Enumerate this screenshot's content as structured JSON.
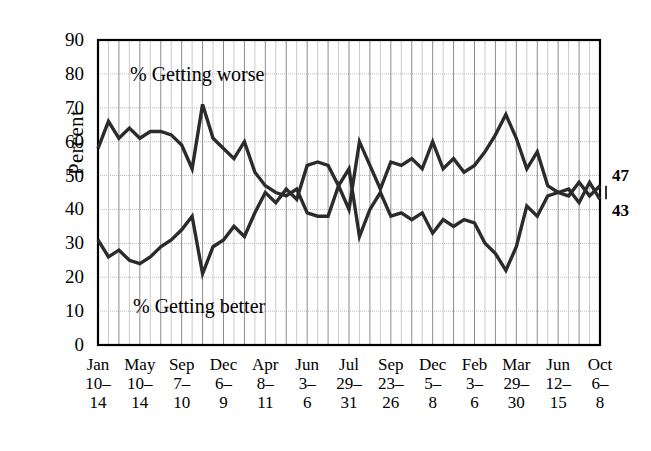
{
  "chart_data": {
    "type": "line",
    "title": "",
    "xlabel": "",
    "ylabel": "Percent",
    "ylim": [
      0,
      90
    ],
    "ytick_step": 10,
    "yticks": [
      "0",
      "10",
      "20",
      "30",
      "40",
      "50",
      "60",
      "70",
      "80",
      "90"
    ],
    "grid": true,
    "grid_vertical": true,
    "legend_position": "inline-annotation",
    "annotations": [
      {
        "text": "% Getting worse",
        "series": "% Getting worse"
      },
      {
        "text": "% Getting better",
        "series": "% Getting better"
      }
    ],
    "end_labels": [
      {
        "text": "47",
        "series": "% Getting worse",
        "value": 47
      },
      {
        "text": "43",
        "series": "% Getting better",
        "value": 43
      }
    ],
    "xtick_labels": [
      {
        "line1": "Jan",
        "line2": "10–",
        "line3": "14",
        "index": 0
      },
      {
        "line1": "May",
        "line2": "10–",
        "line3": "14",
        "index": 4
      },
      {
        "line1": "Sep",
        "line2": "7–",
        "line3": "10",
        "index": 8
      },
      {
        "line1": "Dec",
        "line2": "6–",
        "line3": "9",
        "index": 12
      },
      {
        "line1": "Apr",
        "line2": "8–",
        "line3": "11",
        "index": 16
      },
      {
        "line1": "Jun",
        "line2": "3–",
        "line3": "6",
        "index": 20
      },
      {
        "line1": "Jul",
        "line2": "29–",
        "line3": "31",
        "index": 24
      },
      {
        "line1": "Sep",
        "line2": "23–",
        "line3": "26",
        "index": 28
      },
      {
        "line1": "Dec",
        "line2": "5–",
        "line3": "8",
        "index": 32
      },
      {
        "line1": "Feb",
        "line2": "3–",
        "line3": "6",
        "index": 36
      },
      {
        "line1": "Mar",
        "line2": "29–",
        "line3": "30",
        "index": 40
      },
      {
        "line1": "Jun",
        "line2": "12–",
        "line3": "15",
        "index": 44
      },
      {
        "line1": "Oct",
        "line2": "6–",
        "line3": "8",
        "index": 48
      }
    ],
    "series": [
      {
        "name": "% Getting worse",
        "color": "#2b2b2b",
        "values": [
          58,
          66,
          61,
          64,
          61,
          63,
          63,
          62,
          59,
          52,
          71,
          61,
          58,
          55,
          60,
          51,
          47,
          45,
          44,
          46,
          39,
          38,
          38,
          47,
          40,
          60,
          53,
          46,
          54,
          53,
          55,
          52,
          60,
          52,
          55,
          51,
          53,
          57,
          62,
          68,
          61,
          52,
          57,
          47,
          45,
          44,
          48,
          44,
          47
        ]
      },
      {
        "name": "% Getting better",
        "color": "#2b2b2b",
        "values": [
          31,
          26,
          28,
          25,
          24,
          26,
          29,
          31,
          34,
          38,
          21,
          29,
          31,
          35,
          32,
          39,
          45,
          42,
          46,
          43,
          53,
          54,
          53,
          47,
          52,
          32,
          40,
          45,
          38,
          39,
          37,
          39,
          33,
          37,
          35,
          37,
          36,
          30,
          27,
          22,
          29,
          41,
          38,
          44,
          45,
          46,
          42,
          48,
          43
        ]
      }
    ]
  }
}
